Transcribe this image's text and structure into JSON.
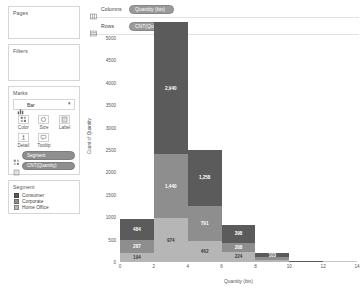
{
  "sidebar": {
    "pages": {
      "title": "Pages"
    },
    "filters": {
      "title": "Filters"
    },
    "marks": {
      "title": "Marks",
      "mark_type": "Bar",
      "mark_type_icon": "bar-mark-icon",
      "caret": "▾",
      "buttons": [
        {
          "label": "Color",
          "icon": "color-icon"
        },
        {
          "label": "Size",
          "icon": "size-icon"
        },
        {
          "label": "Label",
          "icon": "label-icon"
        },
        {
          "label": "Detail",
          "icon": "detail-icon"
        },
        {
          "label": "Tooltip",
          "icon": "tooltip-icon"
        }
      ],
      "pills": [
        {
          "label": "Segment",
          "icon": "color-pill-icon"
        },
        {
          "label": "CNT(Quantity)",
          "icon": "label-pill-icon"
        }
      ]
    },
    "legend": {
      "title": "Segment",
      "items": [
        {
          "label": "Consumer",
          "color": "#5b5b5b"
        },
        {
          "label": "Corporate",
          "color": "#8e8e8e"
        },
        {
          "label": "Home Office",
          "color": "#b6b6b6"
        }
      ]
    }
  },
  "shelves": {
    "columns": {
      "name": "Columns",
      "pill": "Quantity (bin)",
      "icon": "columns-icon"
    },
    "rows": {
      "name": "Rows",
      "pill": "CNT(Quantity)",
      "icon": "rows-icon"
    }
  },
  "chart_data": {
    "type": "bar",
    "title": "",
    "xlabel": "Quantity (bin)",
    "ylabel": "Count of Quantity",
    "stacked": true,
    "grid": false,
    "legend_position": "left-sidebar",
    "xlim": [
      0,
      14
    ],
    "ylim": [
      0,
      5000
    ],
    "ytick_labels": [
      "0",
      "500",
      "1000",
      "1500",
      "2000",
      "2500",
      "3000",
      "3500",
      "4000",
      "4500",
      "5000"
    ],
    "ytick_values": [
      0,
      500,
      1000,
      1500,
      2000,
      2500,
      3000,
      3500,
      4000,
      4500,
      5000
    ],
    "xtick_labels": [
      "0",
      "2",
      "4",
      "6",
      "8",
      "10",
      "12",
      "14"
    ],
    "xtick_values": [
      0,
      2,
      4,
      6,
      8,
      10,
      12,
      14
    ],
    "categories": [
      "0",
      "2",
      "4",
      "6",
      "8",
      "10"
    ],
    "bin_width": 2,
    "series": [
      {
        "name": "Home Office",
        "color": "#b6b6b6",
        "values": [
          194,
          974,
          462,
          224,
          46,
          0
        ]
      },
      {
        "name": "Corporate",
        "color": "#8e8e8e",
        "values": [
          287,
          1440,
          791,
          208,
          57,
          0
        ]
      },
      {
        "name": "Consumer",
        "color": "#5b5b5b",
        "values": [
          484,
          2940,
          1258,
          398,
          103,
          30
        ]
      }
    ],
    "bar_labels": [
      [
        "194",
        "287",
        "484"
      ],
      [
        "974",
        "1,440",
        "2,940"
      ],
      [
        "462",
        "791",
        "1,258"
      ],
      [
        "224",
        "208",
        "398"
      ],
      [
        "",
        "",
        "103"
      ],
      [
        "",
        "",
        ""
      ]
    ]
  }
}
